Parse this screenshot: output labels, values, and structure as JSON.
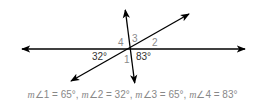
{
  "diagram": {
    "type": "intersecting-lines-angles",
    "lines": [
      {
        "name": "horizontal",
        "x1": 20,
        "y1": 49,
        "x2": 247,
        "y2": 49,
        "arrows": "both"
      },
      {
        "name": "steep",
        "x1": 125,
        "y1": 9,
        "x2": 135,
        "y2": 84,
        "arrows": "both"
      },
      {
        "name": "diagonal",
        "x1": 190,
        "y1": 13,
        "x2": 70,
        "y2": 82,
        "arrows": "both"
      }
    ],
    "intersection": {
      "x": 130,
      "y": 49
    },
    "labels": {
      "angle4": "4",
      "angle3": "3",
      "angle2": "2",
      "angle1": "1",
      "given_left": "32°",
      "given_right": "83°"
    },
    "colors": {
      "line": "#000000",
      "angle_number": "#8a8a8a",
      "degree_label": "#333333",
      "caption": "#888888"
    }
  },
  "caption": {
    "items": [
      {
        "m": "m",
        "angle": "∠1",
        "eq": " = 65°"
      },
      {
        "m": "m",
        "angle": "∠2",
        "eq": " = 32°"
      },
      {
        "m": "m",
        "angle": "∠3",
        "eq": " = 65°"
      },
      {
        "m": "m",
        "angle": "∠4",
        "eq": " = 83°"
      }
    ],
    "separator": ", "
  }
}
